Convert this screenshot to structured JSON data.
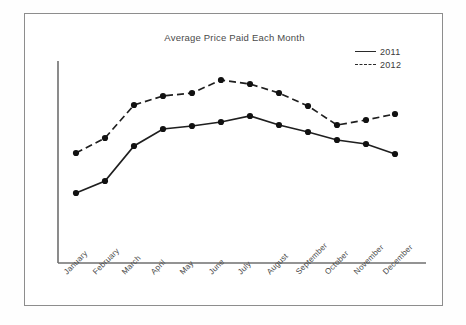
{
  "chart_data": {
    "type": "line",
    "title": "Average Price Paid Each Month",
    "xlabel": "",
    "ylabel": "",
    "grid": false,
    "legend_position": "top-right",
    "categories": [
      "January",
      "February",
      "March",
      "April",
      "May",
      "June",
      "July",
      "August",
      "September",
      "October",
      "November",
      "December"
    ],
    "x": [
      75,
      104,
      133,
      162,
      191,
      220,
      249,
      278,
      307,
      336,
      365,
      394
    ],
    "ylim": [
      0,
      100
    ],
    "series": [
      {
        "name": "2011",
        "style": "solid",
        "marker": "circle",
        "pixel_y": [
          192,
          180,
          145,
          128,
          125,
          121,
          115,
          124,
          131,
          139,
          143,
          153
        ],
        "values": [
          20,
          26,
          44,
          53,
          54,
          56,
          59,
          55,
          51,
          47,
          45,
          40
        ]
      },
      {
        "name": "2012",
        "style": "dashed",
        "marker": "circle",
        "pixel_y": [
          152,
          137,
          104,
          95,
          92,
          79,
          83,
          92,
          105,
          124,
          119,
          113
        ],
        "values": [
          41,
          48,
          65,
          69,
          71,
          77,
          75,
          71,
          64,
          55,
          57,
          60
        ]
      }
    ]
  },
  "legend": {
    "items": [
      {
        "label": "2011",
        "style": "solid"
      },
      {
        "label": "2012",
        "style": "dashed"
      }
    ]
  },
  "axes": {
    "y_axis_top": 47,
    "y_axis_bottom": 249,
    "x_axis_left": 33,
    "x_axis_right": 401,
    "tick_labels_x": [
      "January",
      "February",
      "March",
      "April",
      "May",
      "June",
      "July",
      "August",
      "September",
      "October",
      "November",
      "December"
    ],
    "tick_labels_y": []
  },
  "colors": {
    "line": "#1f1f1f",
    "marker": "#111111",
    "axis": "#6f6f6f",
    "border": "#8d8d8d",
    "text": "#4a4a4a",
    "background": "#ffffff"
  }
}
